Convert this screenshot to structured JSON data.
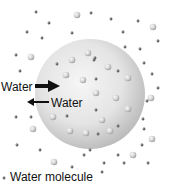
{
  "diagram": {
    "type": "osmosis-cell",
    "labels": {
      "arrow_in": "Water",
      "arrow_out": "Water",
      "legend": "Water molecule"
    },
    "colors": {
      "cell_light": "#f4f4f4",
      "cell_dark": "#bdbdbd",
      "water_molecule": "#555555",
      "solute_light": "#f0f0f0",
      "solute_dark": "#9a9a9a",
      "arrow": "#111111"
    }
  }
}
